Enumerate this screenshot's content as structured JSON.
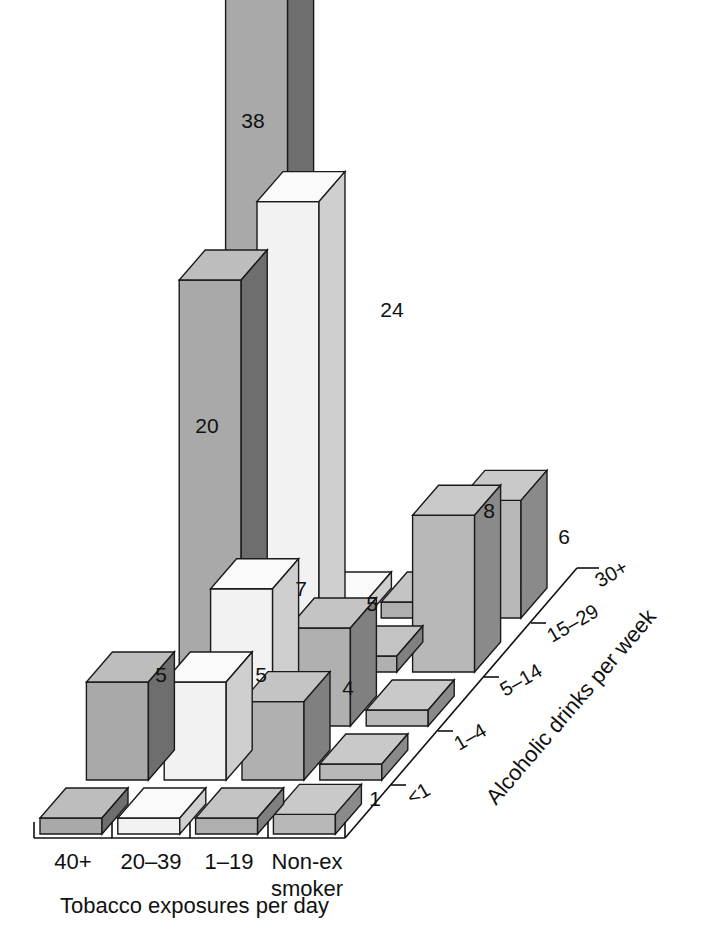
{
  "chart_data": {
    "type": "bar",
    "title": "",
    "subtitle": "",
    "projection": "3d-isometric",
    "xlabel": "Tobacco exposures per day",
    "zlabel": "Alcoholic drinks per week",
    "ylabel": "",
    "categories": [
      "40+",
      "20–39",
      "1–19",
      "Non-ex smoker"
    ],
    "category_display": [
      {
        "line1": "40+",
        "line2": ""
      },
      {
        "line1": "20–39",
        "line2": ""
      },
      {
        "line1": "1–19",
        "line2": ""
      },
      {
        "line1": "Non-ex",
        "line2": "smoker"
      }
    ],
    "depth_levels": [
      "<1",
      "1–4",
      "5–14",
      "15–29",
      "30+"
    ],
    "grid": false,
    "legend": "none",
    "ylim": [
      0,
      38
    ],
    "series": [
      {
        "name": "<1",
        "values": [
          null,
          null,
          null,
          1
        ]
      },
      {
        "name": "1–4",
        "values": [
          5,
          5,
          4,
          null
        ]
      },
      {
        "name": "5–14",
        "values": [
          null,
          7,
          5,
          null
        ]
      },
      {
        "name": "15–29",
        "values": [
          20,
          24,
          null,
          8
        ]
      },
      {
        "name": "30+",
        "values": [
          38,
          null,
          null,
          6
        ]
      }
    ],
    "data_labels": [
      "38",
      "24",
      "20",
      "7",
      "5",
      "5",
      "5",
      "4",
      "8",
      "6",
      "1"
    ],
    "colors": {
      "col_40plus_front": "#a9a9a9",
      "col_40plus_side": "#6e6e6e",
      "col_40plus_top": "#bdbdbd",
      "col_20_39_front": "#f2f2f2",
      "col_20_39_side": "#cfcfcf",
      "col_20_39_top": "#fafafa",
      "col_1_19_front": "#b0b0b0",
      "col_1_19_side": "#808080",
      "col_1_19_top": "#c4c4c4",
      "col_nonex_front": "#b8b8b8",
      "col_nonex_side": "#8a8a8a",
      "col_nonex_top": "#c9c9c9",
      "outline": "#1a1a1a",
      "axis": "#111111",
      "background": "#ffffff"
    }
  },
  "labels": {
    "value_38": "38",
    "value_24": "24",
    "value_20": "20",
    "value_7": "7",
    "value_5a": "5",
    "value_5b": "5",
    "value_5c": "5",
    "value_4": "4",
    "value_8": "8",
    "value_6": "6",
    "value_1": "1"
  },
  "axes": {
    "x_title": "Tobacco exposures per day",
    "z_title": "Alcoholic drinks per week",
    "x_ticks": [
      "40+",
      "20–39",
      "1–19",
      "Non-ex"
    ],
    "x_tick_second_line": "smoker",
    "z_ticks": [
      "<1",
      "1–4",
      "5–14",
      "15–29",
      "30+"
    ]
  },
  "caption": {
    "cut_off_text": ""
  }
}
